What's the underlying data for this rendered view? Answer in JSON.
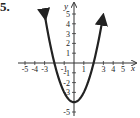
{
  "problem": {
    "number": "5."
  },
  "chart_data": {
    "type": "line",
    "title": "",
    "xlabel": "x",
    "ylabel": "y",
    "function": "y = x^2 - 4",
    "vertex": [
      0,
      -4
    ],
    "x_intercepts": [
      -2,
      2
    ],
    "xlim": [
      -5.5,
      5.5
    ],
    "ylim": [
      -5.5,
      6
    ],
    "x_tick_labels": [
      "-5",
      "-4",
      "-3",
      "-1",
      "1",
      "3",
      "4",
      "5"
    ],
    "x_tick_values": [
      -5,
      -4,
      -3,
      -1,
      1,
      3,
      4,
      5
    ],
    "y_tick_labels": [
      "5",
      "4",
      "3",
      "2",
      "1",
      "-1",
      "-2",
      "-3",
      "-5"
    ],
    "y_tick_values": [
      5,
      4,
      3,
      2,
      1,
      -1,
      -2,
      -3,
      -5
    ],
    "series": [
      {
        "name": "parabola",
        "x": [
          -2.9,
          -2.5,
          -2,
          -1.5,
          -1,
          -0.5,
          0,
          0.5,
          1,
          1.5,
          2,
          2.5,
          2.9
        ],
        "y": [
          4.41,
          2.25,
          0,
          -1.75,
          -3,
          -3.75,
          -4,
          -3.75,
          -3,
          -1.75,
          0,
          2.25,
          4.41
        ]
      }
    ],
    "grid": false,
    "arrows_on_curve_ends": true,
    "colors": {
      "curve": "#222222",
      "axes": "#333333"
    }
  }
}
